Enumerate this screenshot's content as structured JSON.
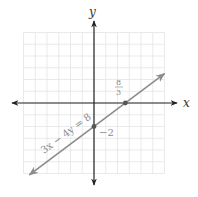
{
  "chart_data": {
    "type": "line",
    "title": "",
    "xlabel": "x",
    "ylabel": "y",
    "xlim": [
      -6,
      6
    ],
    "ylim": [
      -6,
      6
    ],
    "grid": true,
    "grid_step": 1,
    "series": [
      {
        "name": "3x − 4y = 8",
        "equation": "3x - 4y = 8",
        "slope": 0.75,
        "intercept": -2,
        "x": [
          -5.5,
          6
        ],
        "y": [
          -6.125,
          2.5
        ],
        "arrows": "both"
      }
    ],
    "points": [
      {
        "name": "x-intercept",
        "x": 2.667,
        "y": 0,
        "label": "8/3"
      },
      {
        "name": "y-intercept",
        "x": 0,
        "y": -2,
        "label": "−2"
      }
    ],
    "annotations": [
      {
        "text": "3x − 4y = 8",
        "position": "along line, lower-left"
      },
      {
        "text": "8/3",
        "position": "above x-intercept"
      },
      {
        "text": "−2",
        "position": "right of y-intercept"
      }
    ]
  },
  "labels": {
    "x_axis": "x",
    "y_axis": "y",
    "equation": "3x − 4y = 8",
    "x_intercept_num": "8",
    "x_intercept_den": "3",
    "y_intercept": "−2"
  },
  "colors": {
    "axis": "#222222",
    "grid": "#e4e4e4",
    "line": "#8c8c8c",
    "point": "#555555",
    "label_light": "#8a8a8a"
  },
  "layout": {
    "origin_px": [
      94,
      103
    ],
    "unit_px": 11.75
  }
}
